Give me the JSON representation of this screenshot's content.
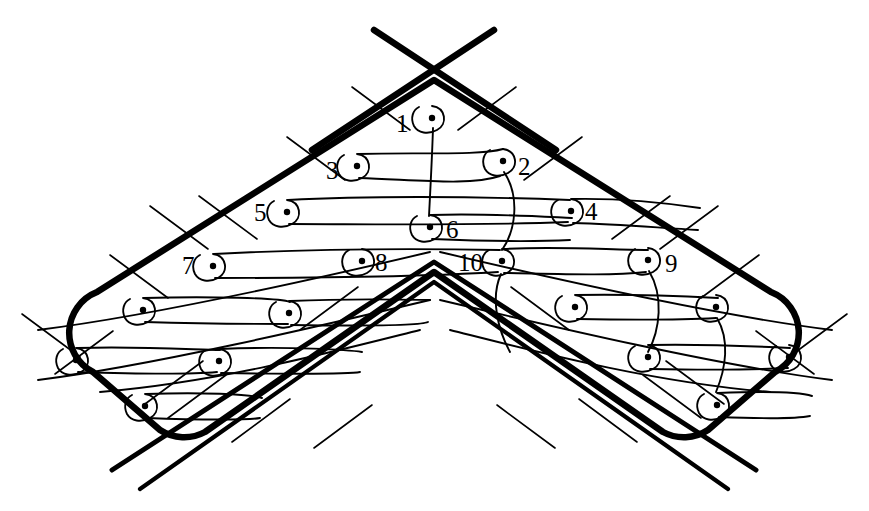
{
  "figure": {
    "kind": "technical-line-drawing",
    "background_color": "#ffffff",
    "ink_color": "#000000"
  },
  "labels": [
    {
      "id": "label-1",
      "text": "1",
      "x": 396,
      "y": 111,
      "marker_x": 432,
      "marker_y": 118
    },
    {
      "id": "label-2",
      "text": "2",
      "x": 518,
      "y": 154,
      "marker_x": 503,
      "marker_y": 161
    },
    {
      "id": "label-3",
      "text": "3",
      "x": 326,
      "y": 158,
      "marker_x": 357,
      "marker_y": 166
    },
    {
      "id": "label-4",
      "text": "4",
      "x": 585,
      "y": 199,
      "marker_x": 571,
      "marker_y": 211
    },
    {
      "id": "label-5",
      "text": "5",
      "x": 254,
      "y": 200,
      "marker_x": 287,
      "marker_y": 212
    },
    {
      "id": "label-6",
      "text": "6",
      "x": 446,
      "y": 217,
      "marker_x": 430,
      "marker_y": 227
    },
    {
      "id": "label-7",
      "text": "7",
      "x": 182,
      "y": 253,
      "marker_x": 213,
      "marker_y": 266
    },
    {
      "id": "label-8",
      "text": "8",
      "x": 375,
      "y": 250,
      "marker_x": 362,
      "marker_y": 261
    },
    {
      "id": "label-9",
      "text": "9",
      "x": 665,
      "y": 251,
      "marker_x": 648,
      "marker_y": 260
    },
    {
      "id": "label-10",
      "text": "10",
      "x": 458,
      "y": 250,
      "marker_x": 502,
      "marker_y": 261
    }
  ],
  "markers": {
    "labeled_count": 10,
    "unlabeled_count": 10,
    "dot_radius": 3.2,
    "loop_radius": 12,
    "unlabeled_points": [
      {
        "x": 143,
        "y": 310
      },
      {
        "x": 76,
        "y": 360
      },
      {
        "x": 289,
        "y": 313
      },
      {
        "x": 219,
        "y": 361
      },
      {
        "x": 145,
        "y": 406
      },
      {
        "x": 575,
        "y": 307
      },
      {
        "x": 716,
        "y": 307
      },
      {
        "x": 648,
        "y": 357
      },
      {
        "x": 789,
        "y": 357
      },
      {
        "x": 717,
        "y": 405
      }
    ]
  },
  "outline": {
    "stroke_width": 6,
    "apex_top": {
      "x": 434,
      "y": 80
    },
    "apex_bottom": {
      "x": 434,
      "y": 262
    },
    "left_tip": {
      "x": 38,
      "y": 355
    },
    "right_tip": {
      "x": 832,
      "y": 355
    },
    "corner_radius": 40
  },
  "inner_chevron": {
    "stroke_width": 5,
    "apex": {
      "x": 434,
      "y": 272
    },
    "offset": 9
  },
  "crossing_lines": {
    "stroke_width": 6,
    "description": "two heavy straight lines crossing above the top apex",
    "top_cross": {
      "x": 434,
      "y": 60
    }
  },
  "hatch_ticks": {
    "stroke_width": 1.6,
    "length": 46,
    "count": 18
  },
  "channel": {
    "stroke_width": 1.8,
    "passes": 5,
    "description": "serpentine flow path with U-bends at each marker"
  }
}
